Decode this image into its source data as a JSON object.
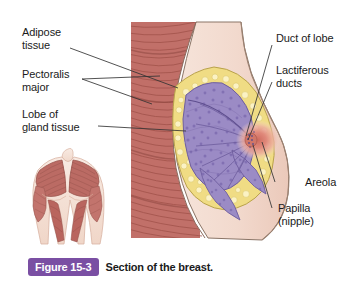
{
  "figure": {
    "badge": "Figure 15-3",
    "caption": "Section of the breast."
  },
  "labels": {
    "left": [
      {
        "id": "adipose-tissue",
        "text": "Adipose\ntissue"
      },
      {
        "id": "pectoralis-major",
        "text": "Pectoralis\nmajor"
      },
      {
        "id": "lobe-of-gland",
        "text": "Lobe of\ngland tissue"
      }
    ],
    "right": [
      {
        "id": "duct-of-lobe",
        "text": "Duct of lobe"
      },
      {
        "id": "lactiferous-ducts",
        "text": "Lactiferous\nducts"
      },
      {
        "id": "areola",
        "text": "Areola"
      },
      {
        "id": "papilla",
        "text": "Papilla\n(nipple)"
      }
    ]
  },
  "colors": {
    "background": "#ffffff",
    "badge_purple": "#7A4FA3",
    "muscle": "#C1706A",
    "muscle_stripe": "#A85952",
    "skin": "#F3DCD1",
    "skin_shadow": "#E8C6B7",
    "adipose": "#F2E08A",
    "adipose_cell": "#FAF0BE",
    "gland": "#9C8CC6",
    "gland_dark": "#7C6BAE",
    "areola": "#E8998D",
    "nipple": "#D97A6E",
    "outline": "#6B5F52",
    "leader": "#3A3A3A",
    "text": "#1b1b1b"
  },
  "illustration": {
    "main_view": "sagittal-section-of-breast",
    "inset_view": "anterior-torso-pectoralis-muscles"
  }
}
